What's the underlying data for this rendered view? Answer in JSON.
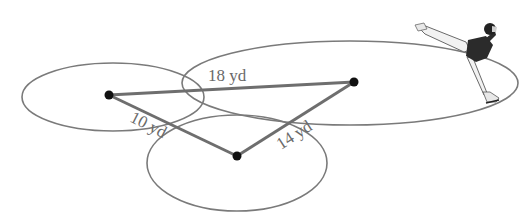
{
  "diagram": {
    "colors": {
      "ellipse_stroke": "#7a7a7a",
      "segment_stroke": "#6e6e6e",
      "point_fill": "#111111",
      "label_fill": "#6a6a6a"
    },
    "points": [
      {
        "id": "left-center"
      },
      {
        "id": "right-center"
      },
      {
        "id": "bottom-center"
      }
    ],
    "segments": [
      {
        "id": "left-to-right",
        "from": "left-center",
        "to": "right-center",
        "label": "18 yd",
        "length": 18,
        "unit": "yd"
      },
      {
        "id": "left-to-bottom",
        "from": "left-center",
        "to": "bottom-center",
        "label": "10 yd",
        "length": 10,
        "unit": "yd"
      },
      {
        "id": "bottom-to-right",
        "from": "bottom-center",
        "to": "right-center",
        "label": "14 yd",
        "length": 14,
        "unit": "yd"
      }
    ],
    "figure": "figure-skater"
  }
}
